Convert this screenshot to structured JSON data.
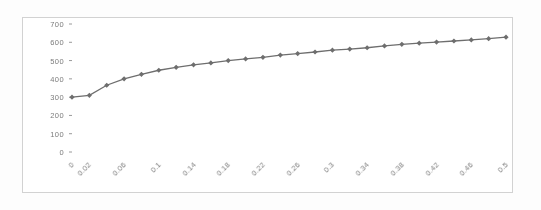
{
  "chart_data": {
    "type": "line",
    "title": "",
    "subtitle": "",
    "xlabel": "",
    "ylabel": "",
    "grid": false,
    "legend": false,
    "legend_position": "none",
    "marker": "diamond",
    "series_color": "#6e6e6e",
    "axis_color": "#8a8a8a",
    "border_color": "#d2d2d2",
    "ylim": [
      0,
      700
    ],
    "ytick_labels": [
      "0",
      "100",
      "200",
      "300",
      "400",
      "500",
      "600",
      "700"
    ],
    "ytick_values": [
      0,
      100,
      200,
      300,
      400,
      500,
      600,
      700
    ],
    "xlim": [
      0,
      0.5
    ],
    "xtick_labels": [
      "0",
      "0.02",
      "0.06",
      "0.1",
      "0.14",
      "0.18",
      "0.22",
      "0.26",
      "0.3",
      "0.34",
      "0.38",
      "0.42",
      "0.46",
      "0.5"
    ],
    "xtick_values": [
      0,
      0.02,
      0.06,
      0.1,
      0.14,
      0.18,
      0.22,
      0.26,
      0.3,
      0.34,
      0.38,
      0.42,
      0.46,
      0.5
    ],
    "x": [
      0,
      0.02,
      0.04,
      0.06,
      0.08,
      0.1,
      0.12,
      0.14,
      0.16,
      0.18,
      0.2,
      0.22,
      0.24,
      0.26,
      0.28,
      0.3,
      0.32,
      0.34,
      0.36,
      0.38,
      0.4,
      0.42,
      0.44,
      0.46,
      0.48,
      0.5
    ],
    "values": [
      300,
      310,
      365,
      400,
      425,
      447,
      463,
      477,
      487,
      500,
      509,
      518,
      530,
      538,
      547,
      557,
      563,
      570,
      580,
      589,
      595,
      601,
      607,
      613,
      620,
      628
    ],
    "series": [
      {
        "name": "series-1",
        "values": [
          300,
          310,
          365,
          400,
          425,
          447,
          463,
          477,
          487,
          500,
          509,
          518,
          530,
          538,
          547,
          557,
          563,
          570,
          580,
          589,
          595,
          601,
          607,
          613,
          620,
          628
        ]
      }
    ]
  }
}
